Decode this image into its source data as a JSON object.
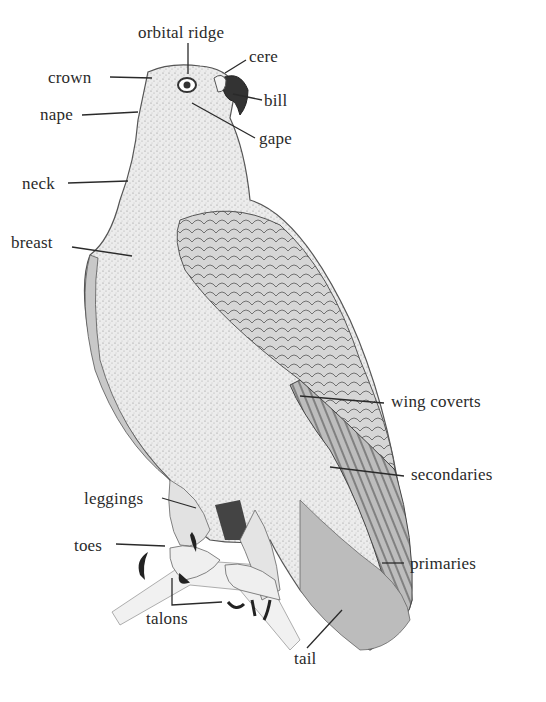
{
  "diagram": {
    "colors": {
      "ink": "#2a2a2a",
      "background": "#ffffff",
      "body_fill": "#e9e9e9",
      "wing_fill": "#cfcfcf",
      "dark_fill": "#555555"
    },
    "labels": [
      {
        "id": "orbital-ridge",
        "text": "orbital ridge",
        "x": 138,
        "y": 24
      },
      {
        "id": "cere",
        "text": "cere",
        "x": 249,
        "y": 48
      },
      {
        "id": "crown",
        "text": "crown",
        "x": 48,
        "y": 69
      },
      {
        "id": "bill",
        "text": "bill",
        "x": 264,
        "y": 92
      },
      {
        "id": "nape",
        "text": "nape",
        "x": 40,
        "y": 106
      },
      {
        "id": "gape",
        "text": "gape",
        "x": 259,
        "y": 130
      },
      {
        "id": "neck",
        "text": "neck",
        "x": 22,
        "y": 175
      },
      {
        "id": "breast",
        "text": "breast",
        "x": 11,
        "y": 234
      },
      {
        "id": "wing-coverts",
        "text": "wing coverts",
        "x": 391,
        "y": 393
      },
      {
        "id": "secondaries",
        "text": "secondaries",
        "x": 411,
        "y": 466
      },
      {
        "id": "leggings",
        "text": "leggings",
        "x": 84,
        "y": 490
      },
      {
        "id": "toes",
        "text": "toes",
        "x": 74,
        "y": 537
      },
      {
        "id": "primaries",
        "text": "primaries",
        "x": 410,
        "y": 555
      },
      {
        "id": "talons",
        "text": "talons",
        "x": 146,
        "y": 610
      },
      {
        "id": "tail",
        "text": "tail",
        "x": 294,
        "y": 650
      }
    ]
  }
}
